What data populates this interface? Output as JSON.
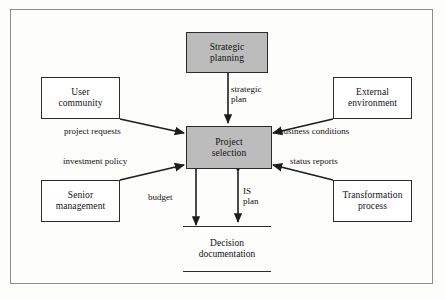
{
  "diagram": {
    "frame": {
      "border_color": "#8d8d8d"
    },
    "colors": {
      "shaded_fill": "#bcbcbc",
      "plain_fill": "#ffffff",
      "stroke": "#2b2b2b",
      "text": "#111111",
      "background": "#fdfdfc"
    },
    "nodes": [
      {
        "id": "strategic-planning",
        "label_line1": "Strategic",
        "label_line2": "planning",
        "style": "shaded"
      },
      {
        "id": "user-community",
        "label_line1": "User",
        "label_line2": "community",
        "style": "plain"
      },
      {
        "id": "external-environment",
        "label_line1": "External",
        "label_line2": "environment",
        "style": "plain"
      },
      {
        "id": "senior-management",
        "label_line1": "Senior",
        "label_line2": "management",
        "style": "plain"
      },
      {
        "id": "transformation-process",
        "label_line1": "Transformation",
        "label_line2": "process",
        "style": "plain"
      },
      {
        "id": "project-selection",
        "label_line1": "Project",
        "label_line2": "selection",
        "style": "shaded"
      },
      {
        "id": "decision-documentation",
        "label_line1": "Decision",
        "label_line2": "documentation",
        "style": "document"
      }
    ],
    "edges": [
      {
        "id": "strategic-plan",
        "from": "strategic-planning",
        "to": "project-selection",
        "label_line1": "strategic",
        "label_line2": "plan",
        "direction": "one-way"
      },
      {
        "id": "project-requests",
        "from": "user-community",
        "to": "project-selection",
        "label_line1": "project requests",
        "label_line2": "",
        "direction": "one-way"
      },
      {
        "id": "business-conditions",
        "from": "external-environment",
        "to": "project-selection",
        "label_line1": "business conditions",
        "label_line2": "",
        "direction": "one-way"
      },
      {
        "id": "investment-policy",
        "from": "senior-management",
        "to": "project-selection",
        "label_line1": "investment policy",
        "label_line2": "",
        "direction": "one-way"
      },
      {
        "id": "status-reports",
        "from": "transformation-process",
        "to": "project-selection",
        "label_line1": "status reports",
        "label_line2": "",
        "direction": "one-way"
      },
      {
        "id": "budget",
        "from": "project-selection",
        "to": "decision-documentation",
        "label_line1": "budget",
        "label_line2": "",
        "direction": "one-way"
      },
      {
        "id": "is-plan",
        "from": "decision-documentation",
        "to": "project-selection",
        "label_line1": "IS",
        "label_line2": "plan",
        "direction": "two-way"
      }
    ]
  }
}
